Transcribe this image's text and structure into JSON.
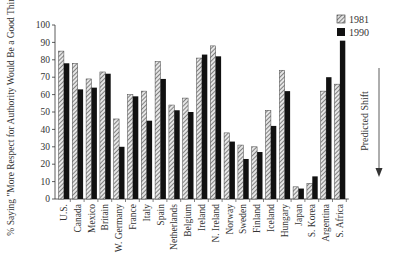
{
  "chart_data": {
    "type": "bar",
    "title": "",
    "xlabel": "",
    "ylabel": "% Saying \"More Respect for Authority Would Be a Good Thing\"",
    "ylim": [
      0,
      100
    ],
    "yticks": [
      0,
      10,
      20,
      30,
      40,
      50,
      60,
      70,
      80,
      90,
      100
    ],
    "grid": false,
    "legend_position": "top-right",
    "annotation": "Predicted Shift",
    "categories": [
      "U.S.",
      "Canada",
      "Mexico",
      "Britain",
      "W. Germany",
      "France",
      "Italy",
      "Spain",
      "Netherlands",
      "Belgium",
      "Ireland",
      "N. Ireland",
      "Norway",
      "Sweden",
      "Finland",
      "Iceland",
      "Hungary",
      "Japan",
      "S. Korea",
      "Argentina",
      "S. Africa"
    ],
    "series": [
      {
        "name": "1981",
        "pattern": "hatched",
        "values": [
          85,
          78,
          69,
          73,
          46,
          60,
          62,
          79,
          54,
          58,
          81,
          88,
          38,
          31,
          30,
          51,
          74,
          7,
          9,
          62,
          66
        ]
      },
      {
        "name": "1990",
        "pattern": "solid",
        "values": [
          78,
          63,
          64,
          72,
          30,
          59,
          45,
          69,
          51,
          50,
          83,
          82,
          33,
          23,
          27,
          42,
          62,
          6,
          13,
          70,
          91
        ]
      }
    ]
  },
  "colors": {
    "series_1990": "#111111",
    "hatch_dark": "#555555",
    "hatch_light": "#dddddd",
    "axis": "#333333"
  }
}
